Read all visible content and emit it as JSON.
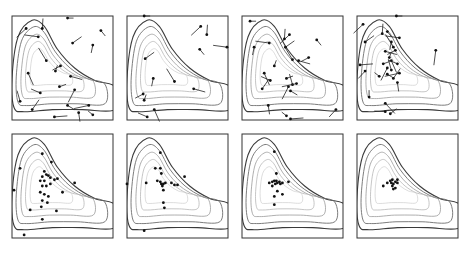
{
  "figure": {
    "layout": {
      "rows": 2,
      "cols": 4
    }
  },
  "chart_data": {
    "type": "scatter",
    "title": "",
    "xlabel": "",
    "ylabel": "",
    "grid": false,
    "legend": null,
    "contour_levels": 5,
    "panels": [
      {
        "index": 1,
        "row": 1,
        "col": 1,
        "particles": [
          [
            0.55,
            0.02
          ],
          [
            0.14,
            0.12
          ],
          [
            0.3,
            0.12
          ],
          [
            0.88,
            0.14
          ],
          [
            0.26,
            0.2
          ],
          [
            0.6,
            0.26
          ],
          [
            0.8,
            0.28
          ],
          [
            0.34,
            0.43
          ],
          [
            0.58,
            0.58
          ],
          [
            0.48,
            0.48
          ],
          [
            0.43,
            0.53
          ],
          [
            0.16,
            0.55
          ],
          [
            0.28,
            0.74
          ],
          [
            0.47,
            0.68
          ],
          [
            0.62,
            0.71
          ],
          [
            0.08,
            0.82
          ],
          [
            0.55,
            0.86
          ],
          [
            0.76,
            0.86
          ],
          [
            0.2,
            0.9
          ],
          [
            0.66,
            0.93
          ],
          [
            0.8,
            0.95
          ],
          [
            0.42,
            0.97
          ]
        ],
        "velocities": true
      },
      {
        "index": 2,
        "row": 1,
        "col": 2,
        "particles": [
          [
            0.17,
            0.0
          ],
          [
            0.73,
            0.1
          ],
          [
            0.79,
            0.18
          ],
          [
            0.72,
            0.32
          ],
          [
            0.99,
            0.3
          ],
          [
            0.18,
            0.41
          ],
          [
            0.26,
            0.6
          ],
          [
            0.47,
            0.63
          ],
          [
            0.66,
            0.7
          ],
          [
            0.16,
            0.75
          ],
          [
            0.17,
            0.81
          ],
          [
            0.27,
            0.9
          ],
          [
            0.2,
            0.97
          ]
        ],
        "velocities": true
      },
      {
        "index": 3,
        "row": 1,
        "col": 3,
        "particles": [
          [
            0.08,
            0.05
          ],
          [
            0.47,
            0.18
          ],
          [
            0.42,
            0.22
          ],
          [
            0.74,
            0.23
          ],
          [
            0.27,
            0.26
          ],
          [
            0.43,
            0.3
          ],
          [
            0.12,
            0.3
          ],
          [
            0.5,
            0.42
          ],
          [
            0.56,
            0.43
          ],
          [
            0.66,
            0.4
          ],
          [
            0.32,
            0.48
          ],
          [
            0.22,
            0.55
          ],
          [
            0.28,
            0.62
          ],
          [
            0.44,
            0.6
          ],
          [
            0.46,
            0.68
          ],
          [
            0.5,
            0.66
          ],
          [
            0.48,
            0.72
          ],
          [
            0.54,
            0.65
          ],
          [
            0.2,
            0.7
          ],
          [
            0.26,
            0.86
          ],
          [
            0.44,
            0.96
          ],
          [
            0.48,
            0.99
          ],
          [
            0.93,
            0.9
          ]
        ],
        "velocities": true
      },
      {
        "index": 4,
        "row": 1,
        "col": 4,
        "particles": [
          [
            0.39,
            0.0
          ],
          [
            0.06,
            0.08
          ],
          [
            0.25,
            0.17
          ],
          [
            0.3,
            0.15
          ],
          [
            0.42,
            0.21
          ],
          [
            0.08,
            0.25
          ],
          [
            0.34,
            0.25
          ],
          [
            0.36,
            0.3
          ],
          [
            0.28,
            0.34
          ],
          [
            0.38,
            0.33
          ],
          [
            0.32,
            0.4
          ],
          [
            0.34,
            0.43
          ],
          [
            0.4,
            0.46
          ],
          [
            0.26,
            0.46
          ],
          [
            0.3,
            0.5
          ],
          [
            0.34,
            0.52
          ],
          [
            0.3,
            0.56
          ],
          [
            0.42,
            0.55
          ],
          [
            0.36,
            0.6
          ],
          [
            0.4,
            0.64
          ],
          [
            0.22,
            0.58
          ],
          [
            0.03,
            0.47
          ],
          [
            0.08,
            0.53
          ],
          [
            0.12,
            0.78
          ],
          [
            0.28,
            0.84
          ],
          [
            0.28,
            0.92
          ],
          [
            0.33,
            0.94
          ],
          [
            0.78,
            0.33
          ]
        ],
        "velocities": true
      },
      {
        "index": 5,
        "row": 2,
        "col": 1,
        "particles": [
          [
            0.3,
            0.19
          ],
          [
            0.39,
            0.27
          ],
          [
            0.08,
            0.33
          ],
          [
            0.32,
            0.36
          ],
          [
            0.34,
            0.39
          ],
          [
            0.3,
            0.41
          ],
          [
            0.36,
            0.4
          ],
          [
            0.38,
            0.42
          ],
          [
            0.28,
            0.45
          ],
          [
            0.32,
            0.45
          ],
          [
            0.42,
            0.44
          ],
          [
            0.45,
            0.43
          ],
          [
            0.3,
            0.5
          ],
          [
            0.34,
            0.5
          ],
          [
            0.38,
            0.48
          ],
          [
            0.28,
            0.56
          ],
          [
            0.32,
            0.58
          ],
          [
            0.36,
            0.6
          ],
          [
            0.3,
            0.64
          ],
          [
            0.35,
            0.66
          ],
          [
            0.29,
            0.7
          ],
          [
            0.5,
            0.56
          ],
          [
            0.62,
            0.47
          ],
          [
            0.02,
            0.54
          ],
          [
            0.18,
            0.73
          ],
          [
            0.44,
            0.74
          ],
          [
            0.3,
            0.82
          ],
          [
            0.12,
            0.97
          ]
        ],
        "velocities": false
      },
      {
        "index": 6,
        "row": 2,
        "col": 2,
        "particles": [
          [
            0.33,
            0.18
          ],
          [
            0.28,
            0.33
          ],
          [
            0.33,
            0.33
          ],
          [
            0.34,
            0.38
          ],
          [
            0.19,
            0.47
          ],
          [
            0.3,
            0.45
          ],
          [
            0.33,
            0.46
          ],
          [
            0.34,
            0.48
          ],
          [
            0.36,
            0.48
          ],
          [
            0.38,
            0.47
          ],
          [
            0.44,
            0.47
          ],
          [
            0.47,
            0.49
          ],
          [
            0.5,
            0.49
          ],
          [
            0.35,
            0.5
          ],
          [
            0.36,
            0.54
          ],
          [
            0.36,
            0.66
          ],
          [
            0.37,
            0.71
          ],
          [
            0.57,
            0.41
          ],
          [
            0.0,
            0.48
          ],
          [
            0.17,
            0.93
          ]
        ],
        "velocities": false
      },
      {
        "index": 7,
        "row": 2,
        "col": 3,
        "particles": [
          [
            0.32,
            0.17
          ],
          [
            0.34,
            0.38
          ],
          [
            0.27,
            0.47
          ],
          [
            0.3,
            0.46
          ],
          [
            0.32,
            0.45
          ],
          [
            0.33,
            0.48
          ],
          [
            0.34,
            0.45
          ],
          [
            0.35,
            0.47
          ],
          [
            0.37,
            0.46
          ],
          [
            0.38,
            0.48
          ],
          [
            0.4,
            0.47
          ],
          [
            0.3,
            0.5
          ],
          [
            0.35,
            0.55
          ],
          [
            0.32,
            0.6
          ],
          [
            0.4,
            0.58
          ],
          [
            0.32,
            0.68
          ],
          [
            0.46,
            0.46
          ]
        ],
        "velocities": false
      },
      {
        "index": 8,
        "row": 2,
        "col": 4,
        "particles": [
          [
            0.26,
            0.5
          ],
          [
            0.3,
            0.47
          ],
          [
            0.33,
            0.45
          ],
          [
            0.34,
            0.47
          ],
          [
            0.35,
            0.44
          ],
          [
            0.35,
            0.5
          ],
          [
            0.36,
            0.48
          ],
          [
            0.36,
            0.53
          ],
          [
            0.38,
            0.46
          ],
          [
            0.38,
            0.52
          ],
          [
            0.4,
            0.44
          ],
          [
            0.4,
            0.47
          ]
        ],
        "velocities": false
      }
    ]
  }
}
